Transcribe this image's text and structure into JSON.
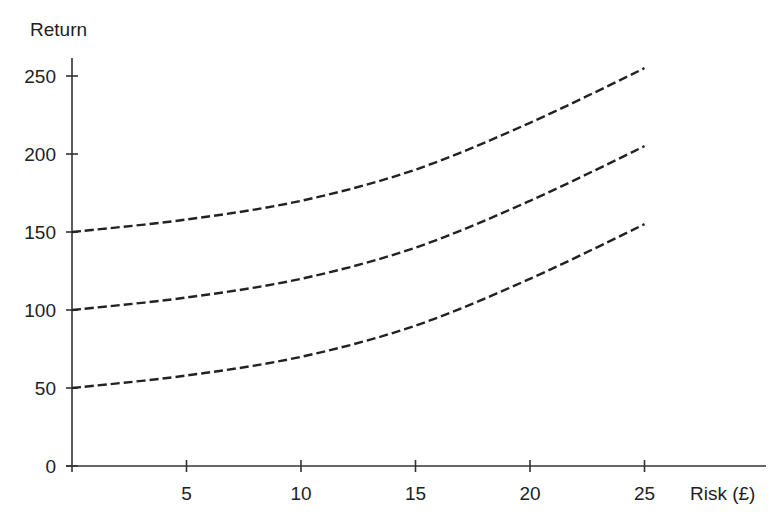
{
  "chart_data": {
    "type": "line",
    "title": "",
    "xlabel": "Risk (£)",
    "ylabel": "Return",
    "xlim": [
      0,
      30
    ],
    "ylim": [
      0,
      260
    ],
    "x_ticks": [
      5,
      10,
      15,
      20,
      25
    ],
    "y_ticks": [
      0,
      50,
      100,
      150,
      200,
      250
    ],
    "grid": false,
    "legend": null,
    "line_style": "dashed",
    "x": [
      0,
      5,
      10,
      15,
      20,
      25
    ],
    "series": [
      {
        "name": "Upper curve",
        "values": [
          150,
          158,
          170,
          190,
          220,
          255
        ]
      },
      {
        "name": "Middle curve",
        "values": [
          100,
          108,
          120,
          140,
          170,
          205
        ]
      },
      {
        "name": "Lower curve",
        "values": [
          50,
          58,
          70,
          90,
          120,
          155
        ]
      }
    ]
  },
  "labels": {
    "y_axis": "Return",
    "x_axis": "Risk (£)"
  }
}
